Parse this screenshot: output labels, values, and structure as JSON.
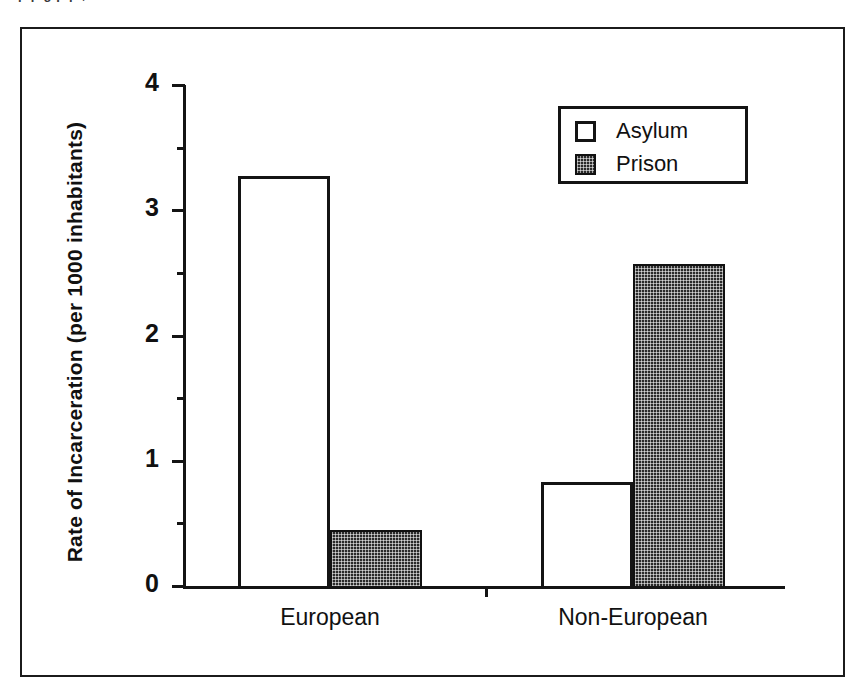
{
  "page": {
    "top_cropped_text": "p     p      g                                p                p   ,"
  },
  "chart_data": {
    "type": "bar",
    "title": "",
    "subtitle": "",
    "xlabel": "",
    "ylabel": "Rate of Incarceration (per 1000 inhabitants)",
    "categories": [
      "European",
      "Non-European"
    ],
    "series": [
      {
        "name": "Asylum",
        "values": [
          3.27,
          0.83
        ],
        "fill": "white",
        "pattern": "solid-white-outline"
      },
      {
        "name": "Prison",
        "values": [
          0.45,
          2.57
        ],
        "fill": "#2a2a2a",
        "pattern": "dark-checkered-hatch"
      }
    ],
    "ylim": [
      0,
      4
    ],
    "ytick_labels": [
      "0",
      "1",
      "2",
      "3",
      "4"
    ],
    "ytick_values": [
      0,
      1,
      2,
      3,
      4
    ],
    "yminor_tick_values": [
      0.5,
      1.5,
      2.5,
      3.5
    ],
    "grid": false,
    "legend": {
      "position": "top-right-inside",
      "entries": [
        {
          "label": "Asylum",
          "swatch": "white-square"
        },
        {
          "label": "Prison",
          "swatch": "dark-hatched-square"
        }
      ]
    },
    "colors": {
      "axis": "#141414",
      "asylum_fill": "#ffffff",
      "prison_fill": "#2a2a2a",
      "frame": "#1b1b1b",
      "background": "#ffffff"
    }
  }
}
